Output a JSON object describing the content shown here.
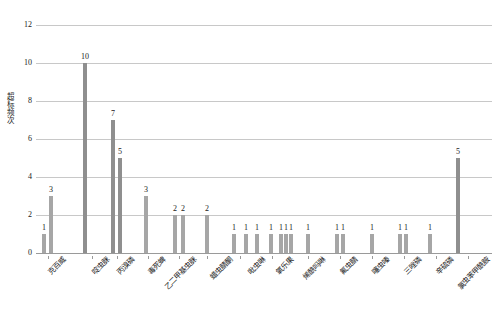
{
  "chart_data": {
    "type": "bar",
    "title": "",
    "xlabel": "",
    "ylabel": "超标频次",
    "ylim": [
      0,
      12
    ],
    "yticks": [
      0,
      2,
      4,
      6,
      8,
      10,
      12
    ],
    "grid": true,
    "legend": false,
    "categories": [
      "克百威",
      "啶虫脒",
      "丙溴磷",
      "毒死蜱",
      "乙二甲基虫脒",
      "吡虫啉",
      "氧乐果",
      "阿维菌素",
      "氟虫腈",
      "甲胺磷",
      "三唑磷",
      "辛硫磷",
      "氯虫苯甲酰胺"
    ],
    "bars": [
      {
        "x": 44,
        "value": 1,
        "label": "1"
      },
      {
        "x": 51,
        "value": 3,
        "label": "3"
      },
      {
        "x": 85,
        "value": 10,
        "label": "10"
      },
      {
        "x": 113,
        "value": 7,
        "label": "7"
      },
      {
        "x": 120,
        "value": 5,
        "label": "5"
      },
      {
        "x": 146,
        "value": 3,
        "label": "3"
      },
      {
        "x": 175,
        "value": 2,
        "label": "2"
      },
      {
        "x": 183,
        "value": 2,
        "label": "2"
      },
      {
        "x": 207,
        "value": 2,
        "label": "2"
      },
      {
        "x": 234,
        "value": 1,
        "label": "1"
      },
      {
        "x": 246,
        "value": 1,
        "label": "1"
      },
      {
        "x": 257,
        "value": 1,
        "label": "1"
      },
      {
        "x": 271,
        "value": 1,
        "label": "1"
      },
      {
        "x": 281,
        "value": 1,
        "label": "1"
      },
      {
        "x": 286,
        "value": 1,
        "label": "1"
      },
      {
        "x": 291,
        "value": 1,
        "label": "1"
      },
      {
        "x": 308,
        "value": 1,
        "label": "1"
      },
      {
        "x": 337,
        "value": 1,
        "label": "1"
      },
      {
        "x": 343,
        "value": 1,
        "label": "1"
      },
      {
        "x": 372,
        "value": 1,
        "label": "1"
      },
      {
        "x": 400,
        "value": 1,
        "label": "1"
      },
      {
        "x": 406,
        "value": 1,
        "label": "1"
      },
      {
        "x": 430,
        "value": 1,
        "label": "1"
      },
      {
        "x": 458,
        "value": 5,
        "label": "5"
      }
    ],
    "tick_positions": [
      48,
      92,
      117,
      148,
      179,
      207,
      240,
      272,
      308,
      340,
      372,
      404,
      436,
      468
    ],
    "xlabel_items": [
      {
        "x": 62,
        "text": "克百威"
      },
      {
        "x": 106,
        "text": "啶虫脒"
      },
      {
        "x": 131,
        "text": "丙溴磷"
      },
      {
        "x": 162,
        "text": "毒死蜱"
      },
      {
        "x": 193,
        "text": "乙二甲基虫脒"
      },
      {
        "x": 229,
        "text": "蜡虫腈酮"
      },
      {
        "x": 262,
        "text": "吡虫啉"
      },
      {
        "x": 290,
        "text": "氧乐果"
      },
      {
        "x": 322,
        "text": "烯酰吗啉"
      },
      {
        "x": 354,
        "text": "氟虫腈"
      },
      {
        "x": 386,
        "text": "噻虫嗪"
      },
      {
        "x": 418,
        "text": "三唑磷"
      },
      {
        "x": 450,
        "text": "辛硫磷"
      },
      {
        "x": 486,
        "text": "氯虫苯甲酰胺"
      }
    ],
    "colors": {
      "bar": "#a6a6a6",
      "grid": "#c8c8c8",
      "axis": "#9a9a9a",
      "text": "#1a1a1a"
    }
  }
}
